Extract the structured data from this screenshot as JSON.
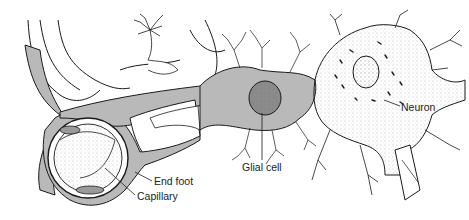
{
  "figure": {
    "colors": {
      "glial_fill": "#b9b9b9",
      "ink": "#1a1a1a",
      "background": "#ffffff",
      "stipple": "#8a8a8a"
    },
    "labels": {
      "end_foot": "End foot",
      "capillary": "Capillary",
      "glial_cell": "Glial cell",
      "neuron": "Neuron"
    }
  }
}
